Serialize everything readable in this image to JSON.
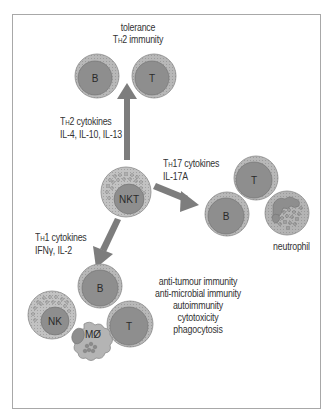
{
  "figure": {
    "colors": {
      "frame": "#a8a8a8",
      "cell_outer": "#b4b4b4",
      "cell_nucleus": "#8c8c8c",
      "arrow": "#7d7d7d",
      "text": "#333333",
      "granule": "#9a9a9a"
    }
  },
  "center_cell": {
    "label": "NKT"
  },
  "branches": {
    "th2": {
      "cytokine_title_prefix": "T",
      "cytokine_title_sub": "H",
      "cytokine_title_rest": "2 cytokines",
      "cytokines": "IL-4, IL-10, IL-13",
      "outcome_line1": "tolerance",
      "outcome_line2_prefix": "T",
      "outcome_line2_sub": "H",
      "outcome_line2_rest": "2 immunity",
      "cells": [
        {
          "label": "B"
        },
        {
          "label": "T"
        }
      ]
    },
    "th17": {
      "cytokine_title_prefix": "T",
      "cytokine_title_sub": "H",
      "cytokine_title_rest": "17 cytokines",
      "cytokines": "IL-17A",
      "cells": [
        {
          "label": "T"
        },
        {
          "label": "B"
        },
        {
          "label": ""
        }
      ],
      "neutrophil_label": "neutrophil"
    },
    "th1": {
      "cytokine_title_prefix": "T",
      "cytokine_title_sub": "H",
      "cytokine_title_rest": "1 cytokines",
      "cytokines": "IFNγ, IL-2",
      "cells": [
        {
          "label": "B"
        },
        {
          "label": "NK"
        },
        {
          "label": "T"
        },
        {
          "label": "MØ"
        }
      ],
      "outcomes": [
        "anti-tumour immunity",
        "anti-microbial immunity",
        "autoimmunity",
        "cytotoxicity",
        "phagocytosis"
      ]
    }
  }
}
